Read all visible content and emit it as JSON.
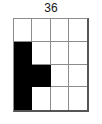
{
  "label": {
    "text": "36"
  },
  "grid": {
    "rows": 4,
    "cols": 4,
    "fill_color": "#000000",
    "empty_color": "#ffffff",
    "gridline_color": "#8c8c8c",
    "border_color": "#555555",
    "cells": [
      [
        0,
        0,
        0,
        0
      ],
      [
        1,
        0,
        0,
        0
      ],
      [
        1,
        1,
        0,
        0
      ],
      [
        1,
        0,
        0,
        0
      ]
    ],
    "filled_count": 4
  }
}
